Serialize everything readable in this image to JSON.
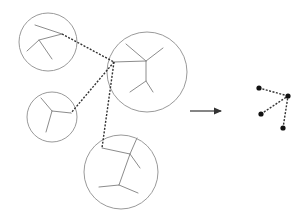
{
  "diagram": {
    "type": "cluster-abstraction",
    "colors": {
      "circle": "#9a9a9a",
      "branch": "#8c8c8c",
      "link": "#333333",
      "node": "#111111",
      "arrow": "#333333"
    },
    "clusters": [
      {
        "id": "cluster-1",
        "circle": {
          "cx": 48,
          "cy": 42,
          "r": 29
        },
        "branches": [
          [
            [
              35,
              25
            ],
            [
              62,
              34
            ]
          ],
          [
            [
              62,
              34
            ],
            [
              39,
              40
            ],
            [
              27,
              51
            ]
          ],
          [
            [
              39,
              40
            ],
            [
              52,
              59
            ]
          ]
        ]
      },
      {
        "id": "cluster-2",
        "circle": {
          "cx": 147,
          "cy": 72,
          "r": 40
        },
        "branches": [
          [
            [
              114,
              62
            ],
            [
              146,
              61
            ]
          ],
          [
            [
              146,
              61
            ],
            [
              126,
              44
            ]
          ],
          [
            [
              146,
              61
            ],
            [
              163,
              48
            ]
          ],
          [
            [
              146,
              61
            ],
            [
              146,
              81
            ],
            [
              153,
              92
            ]
          ],
          [
            [
              146,
              81
            ],
            [
              130,
              92
            ]
          ]
        ]
      },
      {
        "id": "cluster-3",
        "circle": {
          "cx": 52,
          "cy": 117,
          "r": 25
        },
        "branches": [
          [
            [
              71,
              113
            ],
            [
              52,
              111
            ]
          ],
          [
            [
              52,
              111
            ],
            [
              41,
              98
            ]
          ],
          [
            [
              52,
              111
            ],
            [
              46,
              132
            ]
          ]
        ]
      },
      {
        "id": "cluster-4",
        "circle": {
          "cx": 121,
          "cy": 172,
          "r": 37
        },
        "branches": [
          [
            [
              102,
              148
            ],
            [
              130,
              154
            ]
          ],
          [
            [
              130,
              154
            ],
            [
              137,
              138
            ]
          ],
          [
            [
              130,
              154
            ],
            [
              140,
              168
            ]
          ],
          [
            [
              130,
              154
            ],
            [
              119,
              185
            ]
          ],
          [
            [
              119,
              185
            ],
            [
              99,
              187
            ]
          ],
          [
            [
              119,
              185
            ],
            [
              138,
              193
            ]
          ]
        ]
      }
    ],
    "links": [
      {
        "from": "cluster-1",
        "to": "cluster-2",
        "points": [
          [
            62,
            34
          ],
          [
            114,
            62
          ]
        ]
      },
      {
        "from": "cluster-2",
        "to": "cluster-3",
        "points": [
          [
            114,
            62
          ],
          [
            71,
            113
          ]
        ]
      },
      {
        "from": "cluster-2",
        "to": "cluster-4",
        "points": [
          [
            114,
            62
          ],
          [
            102,
            148
          ]
        ]
      }
    ],
    "arrow": {
      "x1": 190,
      "y1": 111,
      "x2": 223,
      "y2": 111
    },
    "abstract_graph": {
      "nodes": [
        {
          "id": "n1",
          "x": 259,
          "y": 88
        },
        {
          "id": "hub",
          "x": 288,
          "y": 96
        },
        {
          "id": "n3",
          "x": 261,
          "y": 114
        },
        {
          "id": "n4",
          "x": 283,
          "y": 128
        }
      ],
      "edges": [
        [
          "n1",
          "hub"
        ],
        [
          "n3",
          "hub"
        ],
        [
          "n4",
          "hub"
        ]
      ]
    }
  }
}
